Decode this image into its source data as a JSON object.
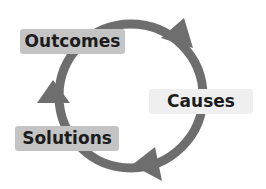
{
  "diagram": {
    "type": "cycle",
    "nodes": [
      {
        "id": "outcomes",
        "label": "Outcomes"
      },
      {
        "id": "causes",
        "label": "Causes"
      },
      {
        "id": "solutions",
        "label": "Solutions"
      }
    ],
    "flow": [
      "Outcomes",
      "Causes",
      "Solutions",
      "Outcomes"
    ],
    "colors": {
      "arrow": "#6e6e6e",
      "label_dark_bg": "#c4c4c4",
      "label_light_bg": "#efefef",
      "text": "#1c1c1c"
    }
  }
}
